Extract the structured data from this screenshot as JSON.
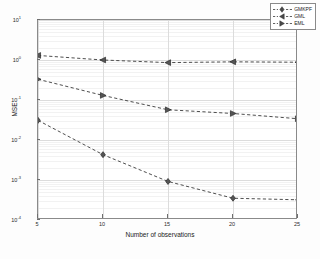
{
  "chart_data": {
    "type": "line",
    "title": "",
    "xlabel": "Number of observations",
    "ylabel": "MSE",
    "x": [
      5,
      10,
      15,
      20,
      25
    ],
    "xlim": [
      5,
      25
    ],
    "ylim": [
      0.0001,
      10
    ],
    "yscale": "log",
    "xscale": "linear",
    "grid": true,
    "legend_position": "upper right",
    "xticks": [
      "5",
      "10",
      "15",
      "20",
      "25"
    ],
    "yticks": [
      "10^1",
      "10^0",
      "10^-1",
      "10^-2",
      "10^-3",
      "10^-4"
    ],
    "ytick_bases": [
      "10",
      "10",
      "10",
      "10",
      "10",
      "10"
    ],
    "ytick_exponents": [
      "1",
      "0",
      "-1",
      "-2",
      "-3",
      "-4"
    ],
    "series": [
      {
        "name": "GMKPF",
        "marker": "diamond",
        "linestyle": "dashed",
        "color": "#3a3a3a",
        "values": [
          0.031,
          0.0043,
          0.00092,
          0.00035,
          0.00032
        ]
      },
      {
        "name": "GML",
        "marker": "left-triangle",
        "linestyle": "dashed",
        "color": "#3a3a3a",
        "values": [
          1.3,
          1.0,
          0.86,
          0.9,
          0.88
        ]
      },
      {
        "name": "EML",
        "marker": "right-triangle",
        "linestyle": "dashed",
        "color": "#3a3a3a",
        "values": [
          0.33,
          0.13,
          0.057,
          0.046,
          0.034
        ]
      }
    ]
  },
  "legend": {
    "entries": [
      {
        "label": "GMKPF"
      },
      {
        "label": "GML"
      },
      {
        "label": "EML"
      }
    ]
  },
  "axes": {
    "x_label": "Number of observations",
    "y_label": "MSE"
  }
}
